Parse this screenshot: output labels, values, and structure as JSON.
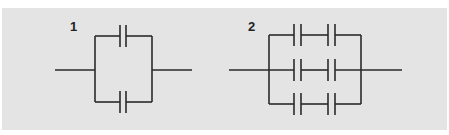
{
  "figure": {
    "background": "#e4e4e4",
    "wire_color": "#2a2a2a",
    "circuits": [
      {
        "label": "1",
        "description": "Two capacitors connected in parallel",
        "capacitors": 2,
        "branches": 2,
        "capacitors_per_branch": 1
      },
      {
        "label": "2",
        "description": "Three parallel branches, each with two capacitors in series",
        "capacitors": 6,
        "branches": 3,
        "capacitors_per_branch": 2
      }
    ]
  }
}
